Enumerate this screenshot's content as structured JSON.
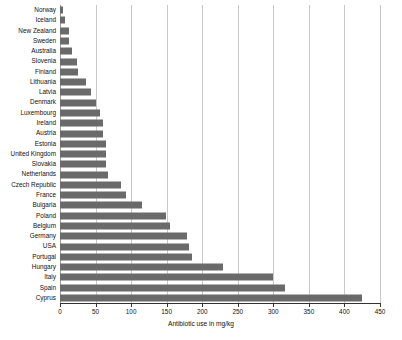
{
  "chart_data": {
    "type": "bar",
    "orientation": "horizontal",
    "title": "",
    "xlabel": "Antibiotic use in mg/kg",
    "ylabel": "",
    "xlim": [
      0,
      450
    ],
    "xticks": [
      0,
      50,
      100,
      150,
      200,
      250,
      300,
      350,
      400,
      450
    ],
    "grid": "vertical",
    "legend": "none",
    "bar_color": "#6a6a6a",
    "grid_color": "#c9c9c9",
    "axis_color": "#333333",
    "categories": [
      "Norway",
      "Iceland",
      "New Zealand",
      "Sweden",
      "Australia",
      "Slovenia",
      "Finland",
      "Lithuania",
      "Latvia",
      "Denmark",
      "Luxembourg",
      "Ireland",
      "Austria",
      "Estonia",
      "United Kingdom",
      "Slovakia",
      "Netherlands",
      "Czech Republic",
      "France",
      "Bulgaria",
      "Poland",
      "Belgium",
      "Germany",
      "USA",
      "Portugal",
      "Hungary",
      "Italy",
      "Spain",
      "Cyprus"
    ],
    "values": [
      4,
      7,
      12,
      13,
      17,
      24,
      25,
      37,
      44,
      51,
      56,
      60,
      61,
      64,
      64,
      65,
      68,
      86,
      93,
      115,
      149,
      155,
      178,
      182,
      186,
      229,
      299,
      316,
      424
    ]
  }
}
